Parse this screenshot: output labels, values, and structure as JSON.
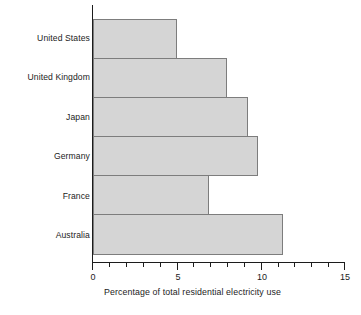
{
  "chart_data": {
    "type": "bar",
    "orientation": "horizontal",
    "title": "",
    "subtitle": "",
    "xlabel": "Percentage of total residential  electricity use",
    "ylabel": "",
    "categories": [
      "United States",
      "United Kingdom",
      "Japan",
      "Germany",
      "France",
      "Australia"
    ],
    "values": [
      5.0,
      8.0,
      9.2,
      9.8,
      6.9,
      11.3
    ],
    "series": [
      {
        "name": "Percentage of total residential electricity use",
        "values": [
          5.0,
          8.0,
          9.2,
          9.8,
          6.9,
          11.3
        ]
      }
    ],
    "xlim": [
      0,
      15
    ],
    "xticks": [
      0,
      5,
      10,
      15
    ],
    "xtick_labels": [
      "0",
      "5",
      "10",
      "15"
    ],
    "minor_tick_step": 1,
    "grid": false,
    "legend": false,
    "legend_position": "none",
    "bar_fill_color": "#d5d5d5",
    "bar_edge_color": "#7d7d7d",
    "axis_color": "#1c1c1c"
  }
}
